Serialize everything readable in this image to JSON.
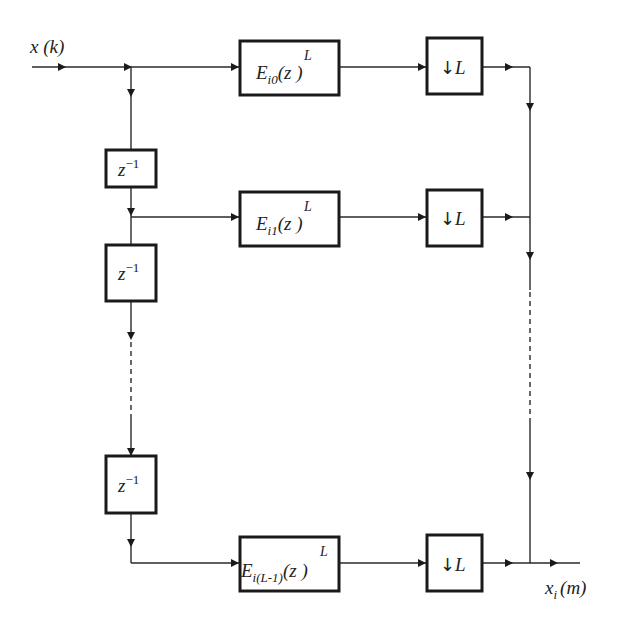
{
  "diagram": {
    "type": "polyphase decimation filter bank",
    "input_label": "x (k)",
    "output_label": "x_i(m)",
    "output_label_main": "x",
    "output_label_sub": "i",
    "output_label_arg": "(m)",
    "delay_blocks": [
      {
        "base": "z",
        "exponent": "−1"
      },
      {
        "base": "z",
        "exponent": "−1"
      },
      {
        "base": "z",
        "exponent": "−1"
      }
    ],
    "filter_blocks": [
      {
        "name": "E",
        "sub": "i0",
        "arg": "(z )",
        "sup": "L"
      },
      {
        "name": "E",
        "sub": "i1",
        "arg": "(z )",
        "sup": "L"
      },
      {
        "name": "E",
        "sub": "i(L-1)",
        "arg": "(z )",
        "sup": "L"
      }
    ],
    "downsampler_blocks": [
      {
        "arrow": "↓",
        "factor": "L"
      },
      {
        "arrow": "↓",
        "factor": "L"
      },
      {
        "arrow": "↓",
        "factor": "L"
      }
    ],
    "colors": {
      "line": "#2a2a2a",
      "box_border": "#1a1a1a",
      "background": "#ffffff"
    }
  }
}
